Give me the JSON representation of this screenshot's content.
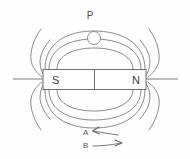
{
  "figure": {
    "background_color": "#fefefe",
    "line_color": "#8a8a8a",
    "label_color": "#4a4a4a"
  },
  "magnet": {
    "south_label": "S",
    "north_label": "N",
    "has_center_divider": true,
    "body_fill": "#ffffff",
    "body_stroke": "#6f6f6f"
  },
  "probe": {
    "label": "P",
    "shape": "circle",
    "description": "small circle positioned on outermost upper field line"
  },
  "arrows": [
    {
      "label": "A",
      "direction": "left",
      "description": "curved arrow pointing left"
    },
    {
      "label": "B",
      "direction": "right",
      "description": "curved arrow pointing right"
    }
  ],
  "field_lines": {
    "upper_loops": 3,
    "lower_loops": 3,
    "open_arcs_left": 2,
    "open_arcs_right": 2,
    "axis_line": true
  }
}
